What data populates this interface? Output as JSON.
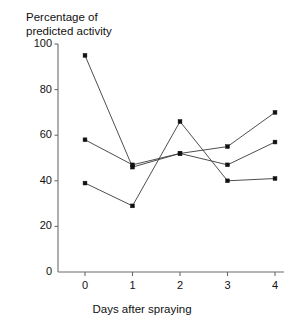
{
  "figure": {
    "cut_off_header_text": "",
    "y_axis_title_line1": "Percentage of",
    "y_axis_title_line2": "predicted activity",
    "x_axis_title": "Days after spraying"
  },
  "chart_data": {
    "type": "line",
    "title": "",
    "xlabel": "Days after spraying",
    "ylabel": "Percentage of predicted activity",
    "x": [
      0,
      1,
      2,
      3,
      4
    ],
    "xticklabels": [
      "0",
      "1",
      "2",
      "3",
      "4"
    ],
    "yticklabels": [
      "0",
      "20",
      "40",
      "60",
      "80",
      "100"
    ],
    "yticks": [
      0,
      20,
      40,
      60,
      80,
      100
    ],
    "xlim": [
      -0.35,
      4.2
    ],
    "ylim": [
      0,
      100
    ],
    "grid": false,
    "legend": "none",
    "marker": "filled-square",
    "series": [
      {
        "name": "series-1",
        "values": [
          95,
          46,
          52,
          55,
          70
        ]
      },
      {
        "name": "series-2",
        "values": [
          58,
          47,
          52,
          47,
          57
        ]
      },
      {
        "name": "series-3",
        "values": [
          39,
          29,
          66,
          40,
          41
        ]
      }
    ]
  },
  "colors": {
    "axis": "#6b6b6b",
    "line": "#3a3a3a",
    "marker": "#111111",
    "text": "#111111",
    "background": "#ffffff"
  }
}
